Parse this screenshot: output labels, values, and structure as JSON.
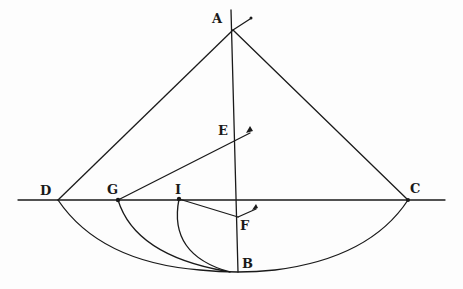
{
  "diagram": {
    "type": "geometric-construction",
    "ink_color": "#1a1a1a",
    "background": "#fdfdfd",
    "points": {
      "A": {
        "label": "A",
        "x": 233,
        "y": 30
      },
      "B": {
        "label": "B",
        "x": 238,
        "y": 272
      },
      "C": {
        "label": "C",
        "x": 408,
        "y": 200
      },
      "D": {
        "label": "D",
        "x": 58,
        "y": 200
      },
      "E": {
        "label": "E",
        "x": 236,
        "y": 140
      },
      "F": {
        "label": "F",
        "x": 238,
        "y": 217
      },
      "G": {
        "label": "G",
        "x": 118,
        "y": 200
      },
      "I": {
        "label": "I",
        "x": 179,
        "y": 199
      }
    },
    "labels": {
      "A": "A",
      "B": "B",
      "C": "C",
      "D": "D",
      "E": "E",
      "F": "F",
      "G": "G",
      "I": "I"
    },
    "segments": [
      [
        "A",
        "D"
      ],
      [
        "A",
        "C"
      ],
      [
        "A",
        "B"
      ],
      [
        "D",
        "C"
      ],
      [
        "G",
        "E"
      ],
      [
        "I",
        "F"
      ]
    ],
    "arcs": [
      {
        "from": "D",
        "via": "B",
        "to": "C"
      },
      {
        "from": "G",
        "to": "B"
      },
      {
        "from": "I",
        "to": "B"
      }
    ]
  }
}
